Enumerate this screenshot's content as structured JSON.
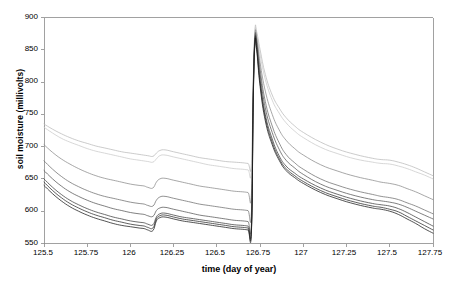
{
  "chart_data": {
    "type": "line",
    "title": "",
    "xlabel": "time (day of year)",
    "ylabel": "soil moisture (millivolts)",
    "xlim": [
      125.5,
      127.75
    ],
    "ylim": [
      550,
      900
    ],
    "xticks": [
      "125.5",
      "125.75",
      "126",
      "126.25",
      "126.5",
      "126.75",
      "127",
      "127.25",
      "127.5",
      "127.75"
    ],
    "xtick_values": [
      125.5,
      125.75,
      126,
      126.25,
      126.5,
      126.75,
      127,
      127.25,
      127.5,
      127.75
    ],
    "yticks": [
      "550",
      "600",
      "650",
      "700",
      "750",
      "800",
      "850",
      "900"
    ],
    "ytick_values": [
      550,
      600,
      650,
      700,
      750,
      800,
      850,
      900
    ],
    "grid": false,
    "legend": false,
    "legend_position": "none",
    "series": [
      {
        "name": "sensor-1",
        "color": "#b9b9b9",
        "x": [
          125.5,
          125.55,
          125.6,
          125.65,
          125.7,
          125.75,
          125.8,
          125.85,
          125.9,
          125.95,
          126.0,
          126.05,
          126.1,
          126.13,
          126.15,
          126.17,
          126.2,
          126.25,
          126.3,
          126.35,
          126.4,
          126.45,
          126.5,
          126.55,
          126.6,
          126.65,
          126.68,
          126.7,
          126.71,
          126.72,
          126.73,
          126.75,
          126.78,
          126.82,
          126.86,
          126.9,
          126.95,
          127.0,
          127.1,
          127.2,
          127.3,
          127.4,
          127.45,
          127.5,
          127.55,
          127.6,
          127.65,
          127.7,
          127.75
        ],
        "y": [
          735,
          727,
          720,
          714,
          709,
          705,
          701,
          698,
          695,
          692,
          690,
          688,
          686,
          685,
          690,
          694,
          695,
          692,
          689,
          686,
          683,
          681,
          679,
          677,
          676,
          675,
          674,
          674,
          800,
          880,
          878,
          850,
          812,
          780,
          760,
          745,
          732,
          722,
          707,
          696,
          688,
          682,
          680,
          679,
          676,
          672,
          667,
          661,
          655
        ]
      },
      {
        "name": "sensor-2",
        "color": "#c9c9c9",
        "x": [
          125.5,
          125.55,
          125.6,
          125.65,
          125.7,
          125.75,
          125.8,
          125.85,
          125.9,
          125.95,
          126.0,
          126.05,
          126.1,
          126.13,
          126.15,
          126.17,
          126.2,
          126.25,
          126.3,
          126.35,
          126.4,
          126.45,
          126.5,
          126.55,
          126.6,
          126.65,
          126.68,
          126.7,
          126.71,
          126.72,
          126.73,
          126.75,
          126.78,
          126.82,
          126.86,
          126.9,
          126.95,
          127.0,
          127.1,
          127.2,
          127.3,
          127.4,
          127.45,
          127.5,
          127.55,
          127.6,
          127.65,
          127.7,
          127.75
        ],
        "y": [
          730,
          721,
          713,
          707,
          702,
          697,
          693,
          690,
          687,
          684,
          681,
          679,
          677,
          676,
          681,
          686,
          687,
          684,
          681,
          678,
          675,
          672,
          670,
          668,
          666,
          665,
          664,
          664,
          795,
          876,
          874,
          842,
          804,
          772,
          752,
          737,
          724,
          714,
          699,
          689,
          681,
          676,
          674,
          673,
          670,
          666,
          661,
          656,
          650
        ]
      },
      {
        "name": "sensor-3",
        "color": "#8a8a8a",
        "x": [
          125.5,
          125.55,
          125.6,
          125.65,
          125.7,
          125.75,
          125.8,
          125.85,
          125.9,
          125.95,
          126.0,
          126.05,
          126.08,
          126.1,
          126.13,
          126.15,
          126.17,
          126.2,
          126.25,
          126.3,
          126.35,
          126.4,
          126.45,
          126.5,
          126.55,
          126.6,
          126.65,
          126.68,
          126.7,
          126.71,
          126.72,
          126.73,
          126.75,
          126.78,
          126.82,
          126.86,
          126.9,
          126.95,
          127.0,
          127.1,
          127.2,
          127.3,
          127.4,
          127.45,
          127.5,
          127.55,
          127.6,
          127.65,
          127.7,
          127.75
        ],
        "y": [
          703,
          691,
          681,
          673,
          666,
          660,
          655,
          651,
          648,
          645,
          642,
          640,
          639,
          637,
          636,
          645,
          650,
          651,
          648,
          645,
          642,
          639,
          637,
          635,
          633,
          631,
          630,
          629,
          628,
          790,
          872,
          869,
          830,
          786,
          750,
          726,
          710,
          697,
          687,
          672,
          662,
          654,
          648,
          645,
          643,
          640,
          635,
          630,
          624,
          618
        ]
      },
      {
        "name": "sensor-4",
        "color": "#6e6e6e",
        "x": [
          125.5,
          125.55,
          125.6,
          125.65,
          125.7,
          125.75,
          125.8,
          125.85,
          125.9,
          125.95,
          126.0,
          126.05,
          126.08,
          126.1,
          126.13,
          126.15,
          126.17,
          126.2,
          126.25,
          126.3,
          126.35,
          126.4,
          126.45,
          126.5,
          126.55,
          126.6,
          126.65,
          126.68,
          126.7,
          126.71,
          126.72,
          126.73,
          126.75,
          126.78,
          126.82,
          126.86,
          126.9,
          126.95,
          127.0,
          127.1,
          127.2,
          127.3,
          127.4,
          127.45,
          127.5,
          127.55,
          127.6,
          127.65,
          127.7,
          127.75
        ],
        "y": [
          678,
          665,
          654,
          645,
          638,
          632,
          627,
          623,
          620,
          617,
          614,
          612,
          611,
          609,
          608,
          617,
          622,
          623,
          620,
          617,
          614,
          611,
          609,
          607,
          605,
          603,
          602,
          601,
          600,
          782,
          868,
          864,
          820,
          770,
          732,
          706,
          688,
          675,
          665,
          650,
          640,
          632,
          626,
          623,
          621,
          618,
          613,
          608,
          602,
          596
        ]
      },
      {
        "name": "sensor-5",
        "color": "#555555",
        "x": [
          125.5,
          125.55,
          125.6,
          125.65,
          125.7,
          125.75,
          125.8,
          125.85,
          125.9,
          125.95,
          126.0,
          126.05,
          126.08,
          126.1,
          126.13,
          126.15,
          126.17,
          126.2,
          126.25,
          126.3,
          126.35,
          126.4,
          126.45,
          126.5,
          126.55,
          126.6,
          126.65,
          126.68,
          126.7,
          126.71,
          126.72,
          126.73,
          126.75,
          126.78,
          126.82,
          126.86,
          126.9,
          126.95,
          127.0,
          127.1,
          127.2,
          127.3,
          127.4,
          127.45,
          127.5,
          127.55,
          127.6,
          127.65,
          127.7,
          127.75
        ],
        "y": [
          663,
          650,
          639,
          630,
          623,
          617,
          612,
          608,
          604,
          601,
          598,
          596,
          595,
          593,
          592,
          601,
          605,
          606,
          603,
          600,
          597,
          594,
          592,
          590,
          588,
          586,
          585,
          584,
          583,
          778,
          866,
          860,
          812,
          760,
          722,
          696,
          679,
          667,
          657,
          642,
          632,
          624,
          618,
          616,
          614,
          611,
          606,
          600,
          594,
          588
        ]
      },
      {
        "name": "sensor-6",
        "color": "#3d3d3d",
        "x": [
          125.5,
          125.55,
          125.6,
          125.65,
          125.7,
          125.75,
          125.8,
          125.85,
          125.9,
          125.95,
          126.0,
          126.05,
          126.08,
          126.1,
          126.13,
          126.15,
          126.17,
          126.2,
          126.25,
          126.3,
          126.35,
          126.4,
          126.45,
          126.5,
          126.55,
          126.6,
          126.65,
          126.68,
          126.7,
          126.71,
          126.72,
          126.73,
          126.75,
          126.78,
          126.82,
          126.86,
          126.9,
          126.95,
          127.0,
          127.1,
          127.2,
          127.3,
          127.4,
          127.45,
          127.5,
          127.55,
          127.6,
          127.65,
          127.7,
          127.75
        ],
        "y": [
          650,
          637,
          626,
          617,
          610,
          604,
          599,
          595,
          591,
          588,
          585,
          583,
          582,
          580,
          579,
          591,
          596,
          597,
          594,
          591,
          589,
          587,
          585,
          583,
          581,
          579,
          578,
          577,
          576,
          772,
          863,
          856,
          803,
          750,
          712,
          686,
          670,
          659,
          650,
          636,
          626,
          618,
          612,
          610,
          608,
          604,
          598,
          591,
          584,
          577
        ]
      },
      {
        "name": "sensor-7",
        "color": "#2a2a2a",
        "x": [
          125.5,
          125.55,
          125.6,
          125.65,
          125.7,
          125.75,
          125.8,
          125.85,
          125.9,
          125.95,
          126.0,
          126.05,
          126.08,
          126.1,
          126.13,
          126.15,
          126.17,
          126.2,
          126.25,
          126.3,
          126.35,
          126.4,
          126.45,
          126.5,
          126.55,
          126.6,
          126.65,
          126.68,
          126.7,
          126.71,
          126.72,
          126.73,
          126.75,
          126.78,
          126.82,
          126.86,
          126.9,
          126.95,
          127.0,
          127.1,
          127.2,
          127.3,
          127.4,
          127.45,
          127.5,
          127.55,
          127.6,
          127.65,
          127.7,
          127.75
        ],
        "y": [
          645,
          632,
          621,
          612,
          605,
          599,
          594,
          590,
          586,
          583,
          580,
          578,
          577,
          575,
          574,
          588,
          593,
          594,
          591,
          588,
          586,
          584,
          582,
          580,
          578,
          576,
          575,
          574,
          573,
          768,
          861,
          853,
          798,
          745,
          707,
          682,
          666,
          655,
          646,
          632,
          622,
          614,
          608,
          606,
          603,
          599,
          592,
          585,
          578,
          571
        ]
      },
      {
        "name": "sensor-8",
        "color": "#1a1a1a",
        "x": [
          125.5,
          125.55,
          125.6,
          125.65,
          125.7,
          125.75,
          125.8,
          125.85,
          125.9,
          125.95,
          126.0,
          126.05,
          126.08,
          126.1,
          126.13,
          126.15,
          126.17,
          126.2,
          126.25,
          126.3,
          126.35,
          126.4,
          126.45,
          126.5,
          126.55,
          126.6,
          126.65,
          126.68,
          126.7,
          126.71,
          126.72,
          126.73,
          126.75,
          126.78,
          126.82,
          126.86,
          126.9,
          126.95,
          127.0,
          127.1,
          127.2,
          127.3,
          127.4,
          127.45,
          127.5,
          127.55,
          127.6,
          127.65,
          127.7,
          127.75
        ],
        "y": [
          640,
          627,
          616,
          607,
          600,
          594,
          589,
          585,
          581,
          578,
          576,
          574,
          573,
          571,
          570,
          585,
          590,
          591,
          588,
          585,
          583,
          581,
          579,
          577,
          575,
          573,
          572,
          571,
          570,
          765,
          859,
          850,
          793,
          740,
          703,
          679,
          663,
          652,
          643,
          629,
          619,
          611,
          605,
          603,
          600,
          595,
          588,
          581,
          573,
          566
        ]
      }
    ],
    "annotations": [
      {
        "label": "spike-event",
        "x": 126.72,
        "y": 890,
        "note": "sharp rise to ~890 mV then exponential decay"
      }
    ]
  },
  "axes": {
    "axis_color": "#8a8a8a",
    "tick_color": "#8a8a8a"
  }
}
